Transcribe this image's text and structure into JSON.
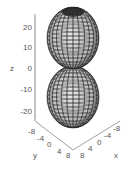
{
  "chart_data": {
    "type": "surface3d",
    "title": "",
    "axes": {
      "x": {
        "label": "x",
        "ticks": [
          "8",
          "4",
          "0",
          "-4",
          "-8"
        ],
        "range": [
          -8,
          8
        ]
      },
      "y": {
        "label": "y",
        "ticks": [
          "-8",
          "-4",
          "0",
          "4",
          "8"
        ],
        "range": [
          -8,
          8
        ]
      },
      "z": {
        "label": "z",
        "ticks": [
          "20",
          "10",
          "0",
          "-10",
          "-20"
        ],
        "range": [
          -25,
          25
        ]
      }
    },
    "surface": {
      "lobes": [
        {
          "name": "upper-lobe",
          "z_range": [
            0,
            25
          ],
          "max_radius": 8
        },
        {
          "name": "lower-lobe",
          "z_range": [
            -25,
            0
          ],
          "max_radius": 8
        }
      ],
      "style": "wireframe-shaded",
      "color": "#c8c8c8",
      "mesh_color": "#222222"
    },
    "grid": false,
    "legend": null
  },
  "labels": {
    "z_axis": "z",
    "y_axis": "y",
    "x_axis": "x",
    "z_ticks": [
      "20",
      "10",
      "0",
      "-10",
      "-20"
    ],
    "y_ticks": [
      "-8",
      "-4",
      "0",
      "4",
      "8"
    ],
    "x_ticks": [
      "8",
      "4",
      "0",
      "-4",
      "-8"
    ]
  }
}
